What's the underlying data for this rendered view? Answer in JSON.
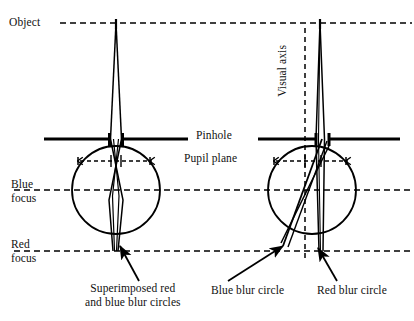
{
  "figure": {
    "background_color": "#ffffff",
    "line_color": "#000000"
  },
  "labels": {
    "object": "Object",
    "pinhole": "Pinhole",
    "pupil_plane": "Pupil plane",
    "blue_focus": "Blue\nfocus",
    "red_focus": "Red\nfocus",
    "visual_axis": "Visual axis",
    "superimposed": "Superimposed red\nand blue blur circles",
    "blue_blur_circle": "Blue blur circle",
    "red_blur_circle": "Red blur circle"
  },
  "diagram_data": {
    "type": "optical-ray-diagram",
    "planes": [
      {
        "name": "object-plane",
        "y": 23,
        "style": "dashed",
        "x_start": 60,
        "x_end": 412
      },
      {
        "name": "pinhole-plane",
        "y": 139,
        "style": "solid-bar"
      },
      {
        "name": "blue-focus-plane",
        "y": 190,
        "style": "dashed",
        "x_start": 14,
        "x_end": 412
      },
      {
        "name": "red-focus-plane",
        "y": 251,
        "style": "dashed",
        "x_start": 14,
        "x_end": 412
      }
    ],
    "eyes": [
      {
        "id": "left-eye",
        "label": "pinhole-eye",
        "circle": {
          "cx": 116,
          "cy": 190,
          "r": 44
        },
        "aperture_x": 116,
        "aperture_half_width": 5,
        "pupil_marker_y": 161,
        "object_point_x": 116
      },
      {
        "id": "right-eye",
        "label": "natural-pupil-eye",
        "circle": {
          "cx": 312,
          "cy": 190,
          "r": 44
        },
        "aperture_x": 322,
        "aperture_half_width": 6,
        "pupil_marker_y": 161,
        "object_point_x": 320,
        "visual_axis_x": 305
      }
    ],
    "bars": [
      {
        "name": "left-pinhole-bar-left",
        "x1": 44,
        "x2": 110,
        "y": 139
      },
      {
        "name": "left-pinhole-bar-right",
        "x1": 122,
        "x2": 188,
        "y": 139
      },
      {
        "name": "right-pinhole-bar-left",
        "x1": 258,
        "x2": 316,
        "y": 139
      },
      {
        "name": "right-pinhole-bar-right",
        "x1": 329,
        "x2": 400,
        "y": 139
      }
    ],
    "callout_arrows": [
      {
        "name": "superimposed-blur-arrow",
        "from": [
          139,
          281
        ],
        "to": [
          119,
          247
        ]
      },
      {
        "name": "blue-blur-arrow",
        "from": [
          228,
          281
        ],
        "to": [
          284,
          247
        ]
      },
      {
        "name": "red-blur-arrow",
        "from": [
          336,
          281
        ],
        "to": [
          317,
          249
        ]
      }
    ]
  }
}
